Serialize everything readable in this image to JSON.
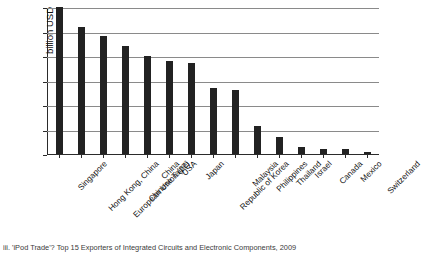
{
  "figure": {
    "caption": "iii. 'iPod Trade'? Top 15 Exporters of Integrated Circuits and Electronic Components, 2009"
  },
  "chart_data": {
    "type": "bar",
    "title": "",
    "subtitle": "",
    "xlabel": "",
    "ylabel": "billion USD",
    "ylim": [
      0,
      60
    ],
    "yticks": [
      0,
      10,
      20,
      30,
      40,
      50,
      60
    ],
    "ytick_labels": [
      "0",
      "10",
      "20",
      "30",
      "40",
      "50",
      "60"
    ],
    "grid": true,
    "grid_axis": "y",
    "legend": false,
    "legend_position": "none",
    "bar_color": "#222222",
    "categories": [
      "Singapore",
      "Hong Kong, China",
      "European Union (27)",
      "Chinese Taipei",
      "China",
      "USA",
      "Japan",
      "Republic of Korea",
      "Malaysia",
      "Philippines",
      "Thailand",
      "Israel",
      "Canada",
      "Mexico",
      "Switzerland"
    ],
    "values": [
      60,
      52,
      48,
      44,
      40,
      38,
      37,
      27,
      26,
      11.5,
      7,
      3,
      2,
      2,
      1
    ],
    "units": "billion USD"
  }
}
